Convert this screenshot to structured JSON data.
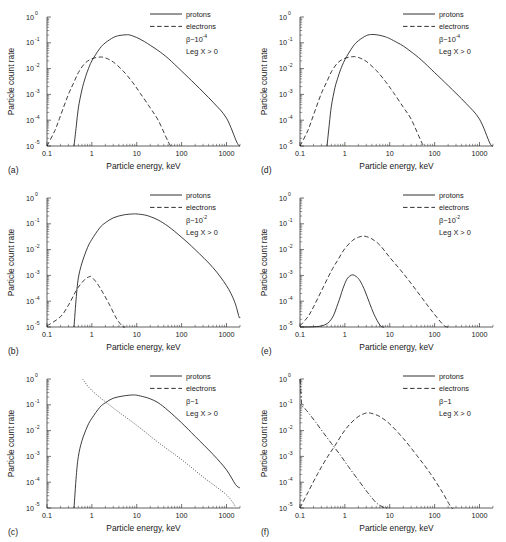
{
  "figure": {
    "axis_titles": {
      "x": "Particle energy, keV",
      "y": "Particle count rate"
    },
    "x_ticks": [
      "0.1",
      "1",
      "10",
      "100",
      "1000"
    ],
    "y_ticks": [
      "10",
      "10",
      "10",
      "10",
      "10",
      "10"
    ],
    "y_tick_exponents": [
      "0",
      "-1",
      "-2",
      "-3",
      "-4",
      "-5"
    ],
    "legend": {
      "protons": "protons",
      "electrons": "electrons",
      "condition": "Leg X > 0"
    }
  },
  "chart_data": [
    {
      "panel": "(a)",
      "type": "line",
      "title": "",
      "xlabel": "Particle energy, keV",
      "ylabel": "Particle count rate",
      "xscale": "log",
      "yscale": "log",
      "xlim": [
        0.1,
        2000
      ],
      "ylim": [
        1e-05,
        1
      ],
      "beta_label": "β~10",
      "beta_exponent": "-4",
      "condition": "Leg X > 0",
      "legend_position": "top-right",
      "grid": false,
      "series": [
        {
          "name": "protons",
          "style": "solid",
          "x": [
            0.4,
            0.45,
            0.5,
            0.6,
            0.7,
            0.8,
            1,
            1.5,
            2,
            3,
            4,
            5,
            6,
            7,
            10,
            15,
            20,
            30,
            50,
            100,
            200,
            500,
            1000,
            1700,
            2000
          ],
          "y": [
            1e-05,
            6e-05,
            0.0003,
            0.0015,
            0.004,
            0.008,
            0.02,
            0.06,
            0.1,
            0.16,
            0.19,
            0.2,
            0.205,
            0.2,
            0.16,
            0.11,
            0.08,
            0.05,
            0.025,
            0.008,
            0.0025,
            0.0005,
            0.00012,
            1.4e-05,
            1e-05
          ]
        },
        {
          "name": "electrons",
          "style": "dashed",
          "x": [
            0.1,
            0.15,
            0.2,
            0.3,
            0.4,
            0.5,
            0.7,
            1,
            1.5,
            2,
            3,
            5,
            8,
            12,
            20,
            30,
            45,
            55,
            60
          ],
          "y": [
            1e-05,
            4e-05,
            0.00015,
            0.001,
            0.003,
            0.007,
            0.016,
            0.024,
            0.028,
            0.026,
            0.018,
            0.008,
            0.003,
            0.0011,
            0.0003,
            0.0001,
            2.2e-05,
            1.1e-05,
            1e-05
          ]
        }
      ]
    },
    {
      "panel": "(d)",
      "type": "line",
      "title": "",
      "xlabel": "Particle energy, keV",
      "ylabel": "Particle count rate",
      "xscale": "log",
      "yscale": "log",
      "xlim": [
        0.1,
        2000
      ],
      "ylim": [
        1e-05,
        1
      ],
      "beta_label": "β~10",
      "beta_exponent": "-4",
      "condition": "Leg X > 0",
      "legend_position": "top-right",
      "grid": false,
      "series": [
        {
          "name": "protons",
          "style": "solid",
          "x": [
            0.4,
            0.45,
            0.5,
            0.6,
            0.7,
            0.8,
            1,
            1.5,
            2,
            3,
            4,
            5,
            6,
            8,
            10,
            15,
            20,
            30,
            50,
            100,
            200,
            500,
            1000,
            1700,
            2000
          ],
          "y": [
            1e-05,
            7e-05,
            0.00035,
            0.0018,
            0.0045,
            0.009,
            0.022,
            0.07,
            0.12,
            0.19,
            0.21,
            0.205,
            0.195,
            0.17,
            0.145,
            0.1,
            0.075,
            0.045,
            0.022,
            0.007,
            0.0022,
            0.00045,
            0.00011,
            1.3e-05,
            1e-05
          ]
        },
        {
          "name": "electrons",
          "style": "dashed",
          "x": [
            0.1,
            0.15,
            0.2,
            0.3,
            0.4,
            0.5,
            0.7,
            1,
            1.5,
            2,
            3,
            5,
            8,
            12,
            20,
            30,
            45,
            55,
            60
          ],
          "y": [
            1e-05,
            4e-05,
            0.00016,
            0.0011,
            0.0032,
            0.0075,
            0.017,
            0.025,
            0.029,
            0.027,
            0.019,
            0.0085,
            0.0032,
            0.0012,
            0.00032,
            0.00011,
            2.3e-05,
            1.1e-05,
            1e-05
          ]
        }
      ]
    },
    {
      "panel": "(b)",
      "type": "line",
      "title": "",
      "xlabel": "Particle energy, keV",
      "ylabel": "Particle count rate",
      "xscale": "log",
      "yscale": "log",
      "xlim": [
        0.1,
        2000
      ],
      "ylim": [
        1e-05,
        1
      ],
      "beta_label": "β~10",
      "beta_exponent": "-2",
      "condition": "Leg X > 0",
      "legend_position": "top-right",
      "grid": false,
      "series": [
        {
          "name": "protons",
          "style": "solid",
          "x": [
            0.4,
            0.45,
            0.5,
            0.6,
            0.8,
            1,
            1.5,
            2,
            3,
            5,
            8,
            10,
            15,
            20,
            30,
            50,
            100,
            200,
            500,
            1000,
            1500,
            1900,
            2000
          ],
          "y": [
            1e-05,
            0.00015,
            0.0008,
            0.003,
            0.012,
            0.025,
            0.07,
            0.11,
            0.17,
            0.22,
            0.24,
            0.24,
            0.22,
            0.19,
            0.14,
            0.08,
            0.03,
            0.01,
            0.002,
            0.0004,
            0.0001,
            2.5e-05,
            2.4e-05
          ]
        },
        {
          "name": "electrons",
          "style": "dashed",
          "x": [
            0.1,
            0.2,
            0.3,
            0.4,
            0.5,
            0.7,
            0.9,
            1.0,
            1.3,
            1.8,
            2.5,
            3.5,
            4.5,
            5,
            5.5
          ],
          "y": [
            1.1e-05,
            2.5e-05,
            7e-05,
            0.00018,
            0.00035,
            0.0007,
            0.0009,
            0.00085,
            0.0005,
            0.0002,
            7e-05,
            2.2e-05,
            1.2e-05,
            1e-05,
            1e-05
          ]
        }
      ]
    },
    {
      "panel": "(e)",
      "type": "line",
      "title": "",
      "xlabel": "Particle energy, keV",
      "ylabel": "Particle count rate",
      "xscale": "log",
      "yscale": "log",
      "xlim": [
        0.1,
        2000
      ],
      "ylim": [
        1e-05,
        1
      ],
      "beta_label": "β~10",
      "beta_exponent": "-2",
      "condition": "Leg X > 0",
      "legend_position": "top-right",
      "grid": false,
      "series": [
        {
          "name": "protons",
          "style": "solid",
          "x": [
            0.1,
            0.3,
            0.5,
            0.7,
            0.9,
            1.1,
            1.3,
            1.5,
            1.8,
            2.2,
            2.8,
            3.5,
            4.5,
            6,
            7,
            7.5
          ],
          "y": [
            1e-05,
            1.1e-05,
            2e-05,
            8e-05,
            0.0003,
            0.0007,
            0.00095,
            0.00105,
            0.0009,
            0.0006,
            0.00025,
            9e-05,
            3e-05,
            1.2e-05,
            1e-05,
            1e-05
          ]
        },
        {
          "name": "electrons",
          "style": "dashed",
          "x": [
            0.1,
            0.15,
            0.2,
            0.3,
            0.5,
            0.7,
            1,
            1.5,
            2,
            2.5,
            3,
            4,
            6,
            10,
            20,
            40,
            80,
            150,
            190,
            210
          ],
          "y": [
            1.1e-05,
            2.5e-05,
            6e-05,
            0.00025,
            0.0015,
            0.004,
            0.011,
            0.023,
            0.03,
            0.033,
            0.032,
            0.026,
            0.015,
            0.005,
            0.0012,
            0.00025,
            5e-05,
            1.3e-05,
            1e-05,
            1e-05
          ]
        }
      ]
    },
    {
      "panel": "(c)",
      "type": "line",
      "title": "",
      "xlabel": "Particle energy, keV",
      "ylabel": "Particle count rate",
      "xscale": "log",
      "yscale": "log",
      "xlim": [
        0.1,
        2000
      ],
      "ylim": [
        1e-05,
        1
      ],
      "beta_label": "β~1",
      "beta_exponent": "",
      "condition": "Leg X > 0",
      "legend_position": "top-right",
      "grid": false,
      "series": [
        {
          "name": "protons",
          "style": "solid",
          "x": [
            0.4,
            0.45,
            0.5,
            0.6,
            0.8,
            1,
            1.5,
            2,
            3,
            5,
            8,
            10,
            15,
            20,
            30,
            50,
            100,
            200,
            500,
            1000,
            1600,
            2000
          ],
          "y": [
            1e-05,
            0.00018,
            0.001,
            0.004,
            0.015,
            0.03,
            0.08,
            0.12,
            0.18,
            0.22,
            0.24,
            0.235,
            0.2,
            0.17,
            0.12,
            0.06,
            0.02,
            0.006,
            0.0012,
            0.0003,
            8e-05,
            6e-05
          ]
        },
        {
          "name": "electrons",
          "style": "dotted",
          "x": [
            0.62,
            1,
            3,
            10,
            30,
            100,
            300,
            1000,
            1600
          ],
          "y": [
            1.0,
            0.36,
            0.075,
            0.016,
            0.0035,
            0.00075,
            0.00016,
            3.2e-05,
            1.1e-05
          ]
        }
      ]
    },
    {
      "panel": "(f)",
      "type": "line",
      "title": "",
      "xlabel": "Particle energy, keV",
      "ylabel": "Particle count rate",
      "xscale": "log",
      "yscale": "log",
      "xlim": [
        0.1,
        2000
      ],
      "ylim": [
        1e-05,
        1
      ],
      "beta_label": "β~1",
      "beta_exponent": "",
      "condition": "Leg X > 0",
      "legend_position": "top-right",
      "grid": false,
      "series": [
        {
          "name": "protons",
          "style": "dashdot",
          "x": [
            0.1,
            0.105,
            0.11,
            0.13,
            0.16,
            0.22,
            0.32,
            0.5,
            0.8,
            1.2,
            2,
            3.2,
            5,
            7,
            9,
            10
          ],
          "y": [
            1.0,
            0.3,
            0.1,
            0.07,
            0.045,
            0.022,
            0.009,
            0.0032,
            0.0011,
            0.0004,
            0.00012,
            4e-05,
            1.6e-05,
            1.1e-05,
            1e-05,
            1e-05
          ]
        },
        {
          "name": "electrons",
          "style": "dashed",
          "x": [
            0.1,
            0.15,
            0.25,
            0.4,
            0.6,
            0.9,
            1.3,
            2,
            3,
            4,
            6,
            10,
            20,
            40,
            80,
            150,
            230,
            260
          ],
          "y": [
            1e-05,
            4e-05,
            0.00022,
            0.0009,
            0.0026,
            0.008,
            0.018,
            0.035,
            0.048,
            0.046,
            0.035,
            0.018,
            0.005,
            0.0011,
            0.00022,
            4e-05,
            1.1e-05,
            1e-05
          ]
        }
      ]
    }
  ]
}
